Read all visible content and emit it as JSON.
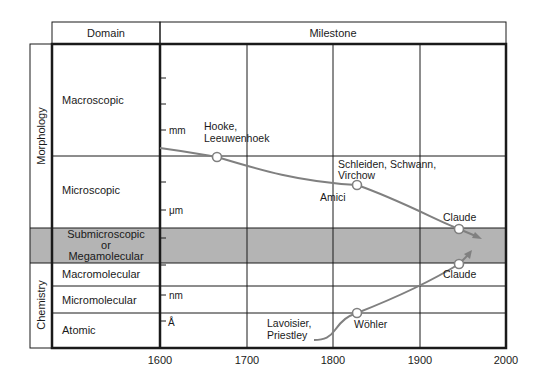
{
  "headers": {
    "domain": "Domain",
    "milestone": "Milestone"
  },
  "categories": [
    {
      "label": "Morphology",
      "y_top": 44,
      "y_bottom": 228
    },
    {
      "label": "Chemistry",
      "y_top": 263,
      "y_bottom": 348
    }
  ],
  "rows": [
    {
      "label": "Macroscopic",
      "y_top": 44,
      "y_bottom": 156,
      "shaded": false
    },
    {
      "label": "Microscopic",
      "y_top": 156,
      "y_bottom": 228,
      "shaded": false
    },
    {
      "label_lines": [
        "Submicroscopic",
        "or",
        "Megamolecular"
      ],
      "y_top": 228,
      "y_bottom": 263,
      "shaded": true
    },
    {
      "label": "Macromolecular",
      "y_top": 263,
      "y_bottom": 286,
      "shaded": false
    },
    {
      "label": "Micromolecular",
      "y_top": 286,
      "y_bottom": 313,
      "shaded": false
    },
    {
      "label": "Atomic",
      "y_top": 313,
      "y_bottom": 348,
      "shaded": false
    }
  ],
  "x_axis": {
    "ticks": [
      {
        "label": "1600",
        "x": 160
      },
      {
        "label": "1700",
        "x": 247
      },
      {
        "label": "1800",
        "x": 333
      },
      {
        "label": "1900",
        "x": 420
      },
      {
        "label": "2000",
        "x": 506
      }
    ]
  },
  "scale_marks": [
    {
      "y": 78,
      "label": ""
    },
    {
      "y": 104,
      "label": ""
    },
    {
      "y": 130,
      "label": "mm"
    },
    {
      "y": 182,
      "label": ""
    },
    {
      "y": 210,
      "label": "μm"
    },
    {
      "y": 238,
      "label": ""
    },
    {
      "y": 265,
      "label": ""
    },
    {
      "y": 295,
      "label": "nm"
    },
    {
      "y": 321,
      "label": "Å"
    }
  ],
  "milestones": [
    {
      "label_lines": [
        "Hooke,",
        "Leeuwenhoek"
      ],
      "year": 1665,
      "point": [
        217,
        157
      ]
    },
    {
      "label_lines": [
        "Schleiden, Schwann,",
        "Virchow"
      ],
      "year": 1838,
      "point": [
        357,
        185
      ]
    },
    {
      "label_lines": [
        "Amici"
      ],
      "year": 1830
    },
    {
      "label_lines": [
        "Claude"
      ],
      "year": 1945,
      "point": [
        459,
        229
      ],
      "track": "morphology"
    },
    {
      "label_lines": [
        "Claude"
      ],
      "year": 1945,
      "point": [
        459,
        264
      ],
      "track": "chemistry"
    },
    {
      "label_lines": [
        "Wöhler"
      ],
      "year": 1828,
      "point": [
        357,
        313
      ]
    },
    {
      "label_lines": [
        "Lavoisier,",
        "Priestley"
      ],
      "year": 1780
    }
  ],
  "colors": {
    "curve": "#808080",
    "shade": "#b4b4b4",
    "grid": "#1a1a1a",
    "text": "#1a1a1a"
  }
}
